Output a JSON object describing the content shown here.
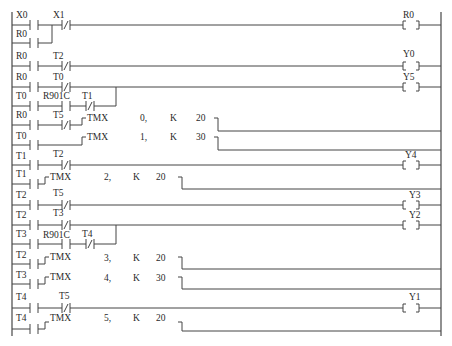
{
  "diagram": {
    "type": "ladder",
    "rungs": [
      {
        "id": 1,
        "contacts": [
          {
            "name": "X0",
            "type": "NO"
          },
          {
            "name": "X1",
            "type": "NC"
          }
        ],
        "branch": [
          {
            "name": "R0",
            "type": "NO"
          }
        ],
        "output": {
          "type": "coil",
          "name": "R0"
        }
      },
      {
        "id": 2,
        "contacts": [
          {
            "name": "R0",
            "type": "NO"
          },
          {
            "name": "T2",
            "type": "NC"
          }
        ],
        "output": {
          "type": "coil",
          "name": "Y0"
        }
      },
      {
        "id": 3,
        "contacts": [
          {
            "name": "R0",
            "type": "NO"
          },
          {
            "name": "T0",
            "type": "NC"
          }
        ],
        "branch": [
          {
            "name": "T0",
            "type": "NO"
          },
          {
            "name": "R901C",
            "type": "NO"
          },
          {
            "name": "T1",
            "type": "NC"
          }
        ],
        "output": {
          "type": "coil",
          "name": "Y5"
        }
      },
      {
        "id": 4,
        "contacts": [
          {
            "name": "R0",
            "type": "NO"
          },
          {
            "name": "T5",
            "type": "NC"
          }
        ],
        "output": {
          "type": "timer",
          "instr": "TMX",
          "num": "0,",
          "k": "K",
          "value": "20"
        }
      },
      {
        "id": 5,
        "contacts": [
          {
            "name": "T0",
            "type": "NO"
          }
        ],
        "output": {
          "type": "timer",
          "instr": "TMX",
          "num": "1,",
          "k": "K",
          "value": "30"
        }
      },
      {
        "id": 6,
        "contacts": [
          {
            "name": "T1",
            "type": "NO"
          },
          {
            "name": "T2",
            "type": "NC"
          }
        ],
        "output": {
          "type": "coil",
          "name": "Y4"
        }
      },
      {
        "id": 7,
        "contacts": [
          {
            "name": "T1",
            "type": "NO"
          }
        ],
        "output": {
          "type": "timer",
          "instr": "TMX",
          "num": "2,",
          "k": "K",
          "value": "20"
        }
      },
      {
        "id": 8,
        "contacts": [
          {
            "name": "T2",
            "type": "NO"
          },
          {
            "name": "T5",
            "type": "NC"
          }
        ],
        "output": {
          "type": "coil",
          "name": "Y3"
        }
      },
      {
        "id": 9,
        "contacts": [
          {
            "name": "T2",
            "type": "NO"
          },
          {
            "name": "T3",
            "type": "NC"
          }
        ],
        "branch": [
          {
            "name": "T3",
            "type": "NO"
          },
          {
            "name": "R901C",
            "type": "NO"
          },
          {
            "name": "T4",
            "type": "NC"
          }
        ],
        "output": {
          "type": "coil",
          "name": "Y2"
        }
      },
      {
        "id": 10,
        "contacts": [
          {
            "name": "T2",
            "type": "NO"
          }
        ],
        "output": {
          "type": "timer",
          "instr": "TMX",
          "num": "3,",
          "k": "K",
          "value": "20"
        }
      },
      {
        "id": 11,
        "contacts": [
          {
            "name": "T3",
            "type": "NO"
          }
        ],
        "output": {
          "type": "timer",
          "instr": "TMX",
          "num": "4,",
          "k": "K",
          "value": "30"
        }
      },
      {
        "id": 12,
        "contacts": [
          {
            "name": "T4",
            "type": "NO"
          },
          {
            "name": "T5",
            "type": "NC"
          }
        ],
        "output": {
          "type": "coil",
          "name": "Y1"
        }
      },
      {
        "id": 13,
        "contacts": [
          {
            "name": "T4",
            "type": "NO"
          }
        ],
        "output": {
          "type": "timer",
          "instr": "TMX",
          "num": "5,",
          "k": "K",
          "value": "20"
        }
      }
    ]
  },
  "labels": {
    "r1": {
      "c1": "X0",
      "c2": "X1",
      "b1": "R0",
      "coil": "R0"
    },
    "r2": {
      "c1": "R0",
      "c2": "T2",
      "coil": "Y0"
    },
    "r3": {
      "c1": "R0",
      "c2": "T0",
      "b1": "T0",
      "b2": "R901C",
      "b3": "T1",
      "coil": "Y5"
    },
    "r4": {
      "c1": "R0",
      "c2": "T5",
      "instr": "TMX",
      "num": "0,",
      "k": "K",
      "val": "20"
    },
    "r5": {
      "c1": "T0",
      "instr": "TMX",
      "num": "1,",
      "k": "K",
      "val": "30"
    },
    "r6": {
      "c1": "T1",
      "c2": "T2",
      "coil": "Y4"
    },
    "r7": {
      "c1": "T1",
      "instr": "TMX",
      "num": "2,",
      "k": "K",
      "val": "20"
    },
    "r8": {
      "c1": "T2",
      "c2": "T5",
      "coil": "Y3"
    },
    "r9": {
      "c1": "T2",
      "c2": "T3",
      "b1": "T3",
      "b2": "R901C",
      "b3": "T4",
      "coil": "Y2"
    },
    "r10": {
      "c1": "T2",
      "instr": "TMX",
      "num": "3,",
      "k": "K",
      "val": "20"
    },
    "r11": {
      "c1": "T3",
      "instr": "TMX",
      "num": "4,",
      "k": "K",
      "val": "30"
    },
    "r12": {
      "c1": "T4",
      "c2": "T5",
      "coil": "Y1"
    },
    "r13": {
      "c1": "T4",
      "instr": "TMX",
      "num": "5,",
      "k": "K",
      "val": "20"
    }
  }
}
